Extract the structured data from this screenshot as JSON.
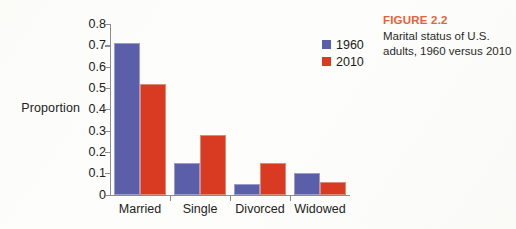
{
  "figure": {
    "title": "FIGURE 2.2",
    "caption": "Marital status of U.S. adults, 1960 versus 2010",
    "title_color": "#e2623a"
  },
  "legend": {
    "position": "top-right",
    "entries": [
      {
        "label": "1960",
        "color": "#5b5ea8"
      },
      {
        "label": "2010",
        "color": "#d93a22"
      }
    ]
  },
  "chart_data": {
    "type": "bar",
    "title": "Marital status of U.S. adults, 1960 versus 2010",
    "xlabel": "",
    "ylabel": "Proportion",
    "ylim": [
      0,
      0.8
    ],
    "yticks": [
      "0",
      "0.1",
      "0.2",
      "0.3",
      "0.4",
      "0.5",
      "0.6",
      "0.7",
      "0.8"
    ],
    "ytick_values": [
      0,
      0.1,
      0.2,
      0.3,
      0.4,
      0.5,
      0.6,
      0.7,
      0.8
    ],
    "grid": false,
    "categories": [
      "Married",
      "Single",
      "Divorced",
      "Widowed"
    ],
    "series": [
      {
        "name": "1960",
        "color": "#5b5ea8",
        "values": [
          0.71,
          0.15,
          0.05,
          0.1
        ]
      },
      {
        "name": "2010",
        "color": "#d93a22",
        "values": [
          0.52,
          0.28,
          0.15,
          0.06
        ]
      }
    ]
  }
}
